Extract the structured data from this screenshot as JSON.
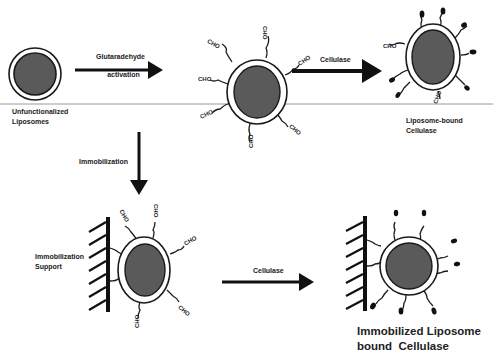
{
  "diagram": {
    "type": "process-flow",
    "colors": {
      "liposome_core": "#5a5a5a",
      "liposome_shell": "#ffffff",
      "stroke": "#1a1a1a",
      "divider": "#9a9a9a",
      "arrow": "#111111"
    },
    "nodes": [
      {
        "id": "unfunc",
        "label_line1": "Unfunctionalized",
        "label_line2": "Liposomes"
      },
      {
        "id": "activated",
        "label": "Glutaraldehyde-activated liposome",
        "group_label": "CHO"
      },
      {
        "id": "bound",
        "label_line1": "Liposome-bound",
        "label_line2": "Cellulase"
      },
      {
        "id": "immob-activated",
        "support_label_line1": "Immobilization",
        "support_label_line2": "Support"
      },
      {
        "id": "immob-bound",
        "label_line1": "Immobilized Liposome",
        "label_line2": "bound  Cellulase"
      }
    ],
    "edges": [
      {
        "from": "unfunc",
        "to": "activated",
        "label_line1": "Glutaradehyde",
        "label_line2": "activation"
      },
      {
        "from": "activated",
        "to": "bound",
        "label": "Cellulase"
      },
      {
        "from": "activated",
        "to": "immob-activated",
        "label": "Immobilization"
      },
      {
        "from": "immob-activated",
        "to": "immob-bound",
        "label": "Cellulase"
      }
    ],
    "cho_label": "CHO"
  }
}
